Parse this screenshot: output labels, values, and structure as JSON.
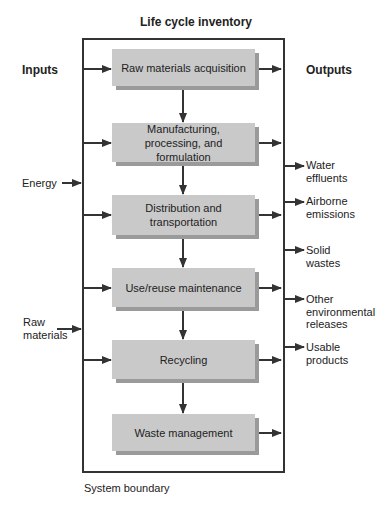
{
  "title": "Life cycle inventory",
  "inputs_header": "Inputs",
  "outputs_header": "Outputs",
  "stages": [
    {
      "label": "Raw materials acquisition"
    },
    {
      "label": "Manufacturing, processing, and formulation"
    },
    {
      "label": "Distribution and transportation"
    },
    {
      "label": "Use/reuse maintenance"
    },
    {
      "label": "Recycling"
    },
    {
      "label": "Waste management"
    }
  ],
  "inputs": [
    {
      "label": "Energy"
    },
    {
      "label": "Raw materials"
    }
  ],
  "outputs": [
    {
      "label": "Water effluents"
    },
    {
      "label": "Airborne emissions"
    },
    {
      "label": "Solid wastes"
    },
    {
      "label": "Other environmental releases"
    },
    {
      "label": "Usable products"
    }
  ],
  "boundary_label": "System boundary",
  "colors": {
    "box_fill": "#c9c9c9",
    "box_shadow": "#9a9a9a",
    "line": "#333333"
  }
}
